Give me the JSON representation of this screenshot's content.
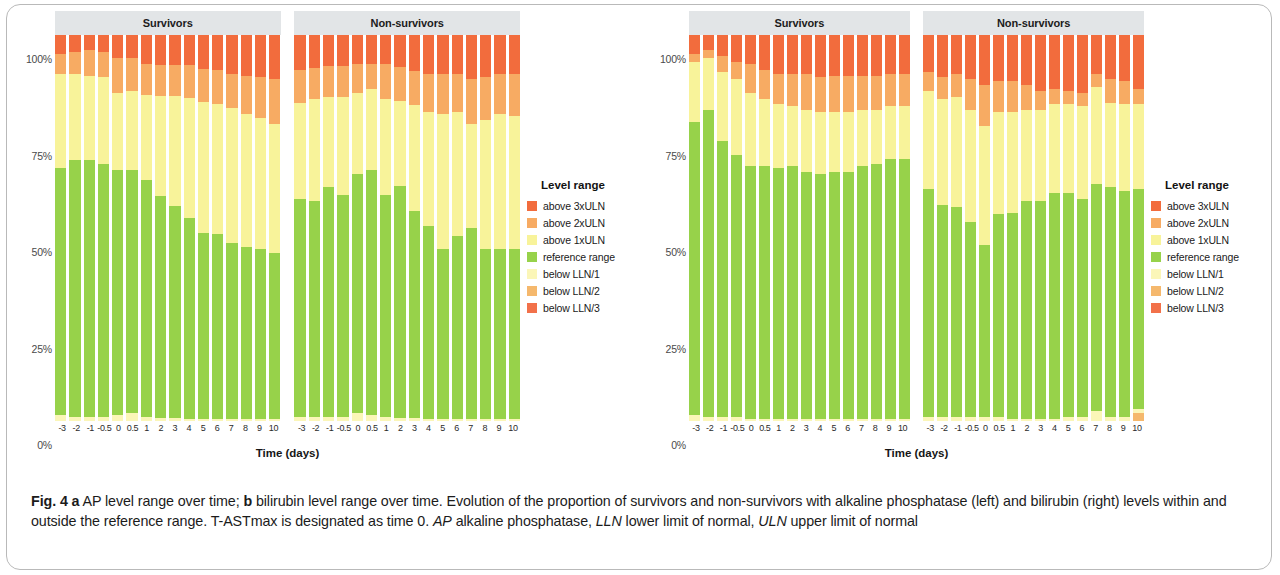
{
  "figure": {
    "label": "Fig. 4",
    "caption_parts": {
      "a_marker": "a",
      "a_text": " AP level range over time; ",
      "b_marker": "b",
      "b_text": " bilirubin level range over time. Evolution of the proportion of survivors and non-survivors with alkaline phosphatase (left) and bilirubin (right) levels within and outside the reference range. T-ASTmax is designated as time 0. ",
      "abbr1": "AP",
      "abbr1_text": " alkaline phosphatase, ",
      "abbr2": "LLN",
      "abbr2_text": " lower limit of normal, ",
      "abbr3": "ULN",
      "abbr3_text": " upper limit of normal"
    }
  },
  "legend": {
    "title": "Level range",
    "items": [
      {
        "label": "above 3xULN",
        "color": "#f26c3d"
      },
      {
        "label": "above 2xULN",
        "color": "#f7ab63"
      },
      {
        "label": "above 1xULN",
        "color": "#f8f39a"
      },
      {
        "label": "reference range",
        "color": "#97d24a"
      },
      {
        "label": "below LLN/1",
        "color": "#fbf6b8"
      },
      {
        "label": "below LLN/2",
        "color": "#f5b86d"
      },
      {
        "label": "below LLN/3",
        "color": "#f2714a"
      }
    ]
  },
  "axes": {
    "y_ticks": [
      "100%",
      "75%",
      "50%",
      "25%",
      "0%"
    ],
    "y_tick_values": [
      100,
      75,
      50,
      25,
      0
    ],
    "x_title": "Time (days)",
    "x_categories": [
      "-3",
      "-2",
      "-1",
      "-0.5",
      "0",
      "0.5",
      "1",
      "2",
      "3",
      "4",
      "5",
      "6",
      "7",
      "8",
      "9",
      "10"
    ]
  },
  "panels": {
    "a_title": "Survivors",
    "b_title": "Non-survivors"
  },
  "chart_data": [
    {
      "id": "a-survivors",
      "type": "bar",
      "stacked": true,
      "title": "a  AP level range over time — Survivors",
      "panel": "a",
      "group": "Survivors",
      "xlabel": "Time (days)",
      "ylabel": "",
      "ylim": [
        0,
        100
      ],
      "grid": false,
      "legend_position": "right",
      "categories": [
        "-3",
        "-2",
        "-1",
        "-0.5",
        "0",
        "0.5",
        "1",
        "2",
        "3",
        "4",
        "5",
        "6",
        "7",
        "8",
        "9",
        "10"
      ],
      "series": [
        {
          "name": "below LLN/3",
          "color": "#f2714a",
          "values": [
            0,
            0,
            0,
            0,
            0,
            0,
            0,
            0,
            0,
            0,
            0,
            0,
            0,
            0,
            0,
            0
          ]
        },
        {
          "name": "below LLN/2",
          "color": "#f5b86d",
          "values": [
            0,
            0,
            0,
            0,
            0,
            0,
            0,
            0,
            0,
            0,
            0,
            0,
            0,
            0,
            0,
            0
          ]
        },
        {
          "name": "below LLN/1",
          "color": "#fbf6b8",
          "values": [
            1.5,
            1.0,
            1.0,
            1.0,
            1.5,
            2.0,
            1.0,
            0.8,
            0.8,
            0.6,
            0.6,
            0.5,
            0.5,
            0.5,
            0.5,
            0.5
          ]
        },
        {
          "name": "reference range",
          "color": "#97d24a",
          "values": [
            64.0,
            66.5,
            66.5,
            65.5,
            63.5,
            63.0,
            61.5,
            57.5,
            55.0,
            52.0,
            48.0,
            48.0,
            45.5,
            44.5,
            44.0,
            43.0
          ]
        },
        {
          "name": "above 1xULN",
          "color": "#f8f39a",
          "values": [
            24.5,
            22.5,
            22.0,
            22.5,
            20.0,
            20.5,
            22.0,
            26.0,
            28.5,
            31.0,
            34.0,
            33.5,
            35.0,
            34.5,
            34.0,
            33.5
          ]
        },
        {
          "name": "above 2xULN",
          "color": "#f7ab63",
          "values": [
            5.0,
            5.5,
            6.5,
            6.5,
            9.0,
            8.5,
            8.0,
            8.0,
            8.0,
            8.5,
            8.5,
            9.0,
            9.0,
            10.0,
            10.5,
            11.5
          ]
        },
        {
          "name": "above 3xULN",
          "color": "#f26c3d",
          "values": [
            5.0,
            4.5,
            4.0,
            4.5,
            6.0,
            6.0,
            7.5,
            7.7,
            7.7,
            7.9,
            8.9,
            9.0,
            10.0,
            10.5,
            11.0,
            11.5
          ]
        }
      ]
    },
    {
      "id": "a-nonsurvivors",
      "type": "bar",
      "stacked": true,
      "title": "a  AP level range over time — Non-survivors",
      "panel": "a",
      "group": "Non-survivors",
      "xlabel": "Time (days)",
      "ylabel": "",
      "ylim": [
        0,
        100
      ],
      "grid": false,
      "legend_position": "right",
      "categories": [
        "-3",
        "-2",
        "-1",
        "-0.5",
        "0",
        "0.5",
        "1",
        "2",
        "3",
        "4",
        "5",
        "6",
        "7",
        "8",
        "9",
        "10"
      ],
      "series": [
        {
          "name": "below LLN/3",
          "color": "#f2714a",
          "values": [
            0,
            0,
            0,
            0,
            0,
            0,
            0,
            0,
            0,
            0,
            0,
            0,
            0,
            0,
            0,
            0
          ]
        },
        {
          "name": "below LLN/2",
          "color": "#f5b86d",
          "values": [
            0,
            0,
            0,
            0,
            0,
            0,
            0,
            0,
            0,
            0,
            0,
            0,
            0,
            0,
            0,
            0
          ]
        },
        {
          "name": "below LLN/1",
          "color": "#fbf6b8",
          "values": [
            1.0,
            1.0,
            1.0,
            1.0,
            2.0,
            1.5,
            1.0,
            0.8,
            0.8,
            0.5,
            0.5,
            0.5,
            0.5,
            0.5,
            0.5,
            0.5
          ]
        },
        {
          "name": "reference range",
          "color": "#97d24a",
          "values": [
            56.5,
            56.0,
            59.5,
            57.5,
            62.0,
            63.5,
            57.5,
            60.0,
            53.5,
            50.0,
            44.0,
            47.5,
            49.5,
            44.0,
            44.0,
            44.0
          ]
        },
        {
          "name": "above 1xULN",
          "color": "#f8f39a",
          "values": [
            25.0,
            26.5,
            23.5,
            25.5,
            21.0,
            21.0,
            25.0,
            22.0,
            27.5,
            29.5,
            35.0,
            32.0,
            27.0,
            33.5,
            35.0,
            34.5
          ]
        },
        {
          "name": "above 2xULN",
          "color": "#f7ab63",
          "values": [
            8.5,
            8.0,
            8.0,
            8.0,
            7.5,
            6.5,
            9.0,
            9.0,
            9.0,
            10.0,
            10.5,
            10.0,
            11.5,
            11.0,
            10.5,
            11.0
          ]
        },
        {
          "name": "above 3xULN",
          "color": "#f26c3d",
          "values": [
            9.0,
            8.5,
            8.0,
            8.0,
            7.5,
            7.5,
            7.5,
            8.2,
            9.2,
            10.0,
            10.0,
            10.0,
            11.5,
            11.0,
            10.0,
            10.0
          ]
        }
      ]
    },
    {
      "id": "b-survivors",
      "type": "bar",
      "stacked": true,
      "title": "b  Bilirubin level range over time — Survivors",
      "panel": "b",
      "group": "Survivors",
      "xlabel": "Time (days)",
      "ylabel": "",
      "ylim": [
        0,
        100
      ],
      "grid": false,
      "legend_position": "right",
      "categories": [
        "-3",
        "-2",
        "-1",
        "-0.5",
        "0",
        "0.5",
        "1",
        "2",
        "3",
        "4",
        "5",
        "6",
        "7",
        "8",
        "9",
        "10"
      ],
      "series": [
        {
          "name": "below LLN/3",
          "color": "#f2714a",
          "values": [
            0,
            0,
            0,
            0,
            0,
            0,
            0,
            0,
            0,
            0,
            0,
            0,
            0,
            0,
            0,
            0
          ]
        },
        {
          "name": "below LLN/2",
          "color": "#f5b86d",
          "values": [
            0,
            0,
            0,
            0,
            0,
            0,
            0,
            0,
            0,
            0,
            0,
            0,
            0,
            0,
            0,
            0
          ]
        },
        {
          "name": "below LLN/1",
          "color": "#fbf6b8",
          "values": [
            1.5,
            1.0,
            1.0,
            1.0,
            0.5,
            0.5,
            0.5,
            0.5,
            0.5,
            0.5,
            0.5,
            0.5,
            0.5,
            0.5,
            0.5,
            0.5
          ]
        },
        {
          "name": "reference range",
          "color": "#97d24a",
          "values": [
            76.0,
            79.5,
            71.5,
            68.0,
            65.5,
            65.5,
            65.0,
            65.5,
            64.0,
            63.5,
            64.0,
            64.0,
            65.5,
            66.0,
            67.5,
            67.5
          ]
        },
        {
          "name": "above 1xULN",
          "color": "#f8f39a",
          "values": [
            15.5,
            13.5,
            18.0,
            19.5,
            19.0,
            17.5,
            16.5,
            15.5,
            16.0,
            16.0,
            15.5,
            15.5,
            14.5,
            14.0,
            13.5,
            13.5
          ]
        },
        {
          "name": "above 2xULN",
          "color": "#f7ab63",
          "values": [
            2.0,
            2.0,
            4.0,
            4.5,
            7.5,
            7.5,
            8.0,
            8.5,
            9.5,
            9.0,
            9.5,
            9.5,
            9.0,
            9.0,
            8.5,
            8.5
          ]
        },
        {
          "name": "above 3xULN",
          "color": "#f26c3d",
          "values": [
            5.0,
            4.0,
            5.5,
            7.0,
            7.5,
            9.0,
            10.0,
            10.0,
            10.0,
            11.0,
            10.5,
            10.5,
            10.5,
            10.5,
            10.0,
            10.0
          ]
        }
      ]
    },
    {
      "id": "b-nonsurvivors",
      "type": "bar",
      "stacked": true,
      "title": "b  Bilirubin level range over time — Non-survivors",
      "panel": "b",
      "group": "Non-survivors",
      "xlabel": "Time (days)",
      "ylabel": "",
      "ylim": [
        0,
        100
      ],
      "grid": false,
      "legend_position": "right",
      "categories": [
        "-3",
        "-2",
        "-1",
        "-0.5",
        "0",
        "0.5",
        "1",
        "2",
        "3",
        "4",
        "5",
        "6",
        "7",
        "8",
        "9",
        "10"
      ],
      "series": [
        {
          "name": "below LLN/3",
          "color": "#f2714a",
          "values": [
            0,
            0,
            0,
            0,
            0,
            0,
            0,
            0,
            0,
            0,
            0,
            0,
            0,
            0,
            0,
            0
          ]
        },
        {
          "name": "below LLN/2",
          "color": "#f5b86d",
          "values": [
            0,
            0,
            0,
            0,
            0,
            0,
            0,
            0,
            0,
            0,
            0,
            0,
            0,
            0,
            0,
            2.0
          ]
        },
        {
          "name": "below LLN/1",
          "color": "#fbf6b8",
          "values": [
            1.0,
            1.0,
            1.0,
            1.0,
            1.0,
            1.0,
            0.5,
            0.5,
            0.5,
            0.5,
            1.0,
            1.0,
            2.5,
            1.0,
            1.0,
            1.0
          ]
        },
        {
          "name": "reference range",
          "color": "#97d24a",
          "values": [
            59.0,
            55.0,
            54.5,
            50.5,
            44.5,
            52.5,
            53.5,
            56.5,
            56.5,
            58.5,
            58.0,
            56.5,
            59.0,
            59.5,
            58.5,
            57.0
          ]
        },
        {
          "name": "above 1xULN",
          "color": "#f8f39a",
          "values": [
            25.5,
            27.5,
            28.5,
            29.0,
            31.0,
            26.5,
            26.0,
            23.5,
            23.5,
            23.0,
            23.0,
            24.0,
            25.0,
            22.0,
            22.5,
            22.0
          ]
        },
        {
          "name": "above 2xULN",
          "color": "#f7ab63",
          "values": [
            5.0,
            5.5,
            6.0,
            8.0,
            10.5,
            8.0,
            8.0,
            6.5,
            5.0,
            4.0,
            3.5,
            3.5,
            3.5,
            6.0,
            6.0,
            4.0
          ]
        },
        {
          "name": "above 3xULN",
          "color": "#f26c3d",
          "values": [
            9.5,
            11.0,
            10.0,
            11.5,
            13.0,
            12.0,
            12.0,
            13.0,
            14.5,
            14.0,
            14.5,
            15.0,
            10.0,
            11.5,
            12.0,
            14.0
          ]
        }
      ]
    }
  ]
}
